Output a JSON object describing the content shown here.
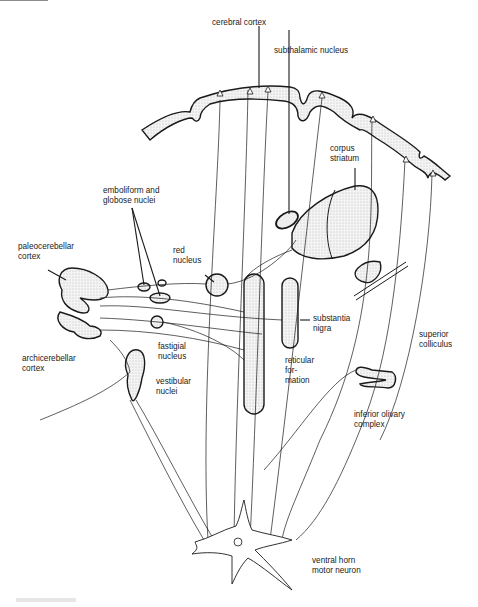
{
  "diagram": {
    "labels": {
      "cerebral_cortex": "cerebral cortex",
      "subthalamic_nucleus": "subthalamic nucleus",
      "corpus_striatum_1": "corpus",
      "corpus_striatum_2": "striatum",
      "emboliform_1": "emboliform and",
      "emboliform_2": "globose nuclei",
      "paleocerebellar_1": "paleocerebellar",
      "paleocerebellar_2": "cortex",
      "red_nucleus_1": "red",
      "red_nucleus_2": "nucleus",
      "substantia_nigra_1": "substantia",
      "substantia_nigra_2": "nigra",
      "archicerebellar_1": "archicerebellar",
      "archicerebellar_2": "cortex",
      "fastigial_1": "fastigial",
      "fastigial_2": "nucleus",
      "superior_colliculus_1": "superior",
      "superior_colliculus_2": "colliculus",
      "vestibular_1": "vestibular",
      "vestibular_2": "nuclei",
      "reticular_1": "reticular",
      "reticular_2": "for-",
      "reticular_3": "mation",
      "inferior_olivary_1": "inferior olivary",
      "inferior_olivary_2": "complex",
      "ventral_horn_1": "ventral horn",
      "ventral_horn_2": "motor neuron"
    },
    "colors": {
      "ink": "#1a1a1a",
      "stipple": "#e4e4e4",
      "paper": "#ffffff"
    }
  }
}
